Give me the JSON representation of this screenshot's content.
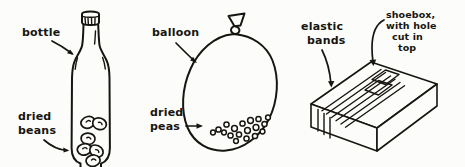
{
  "illustration": {
    "title": "Homemade shaker instruments",
    "style": "hand-drawn black ink line art on white paper",
    "background_color": "#fcfcfa",
    "ink_color": "#17150f"
  },
  "figures": [
    {
      "id": "bottle-figure",
      "object": "bottle",
      "object_icon": "bottle-icon",
      "contents": "dried beans",
      "contents_icon": "bean-icon",
      "contents_count": 6,
      "labels": [
        {
          "text": "bottle",
          "lines": [
            "bottle"
          ],
          "points_to": "bottle neck"
        },
        {
          "text": "dried beans",
          "lines": [
            "dried",
            "beans"
          ],
          "points_to": "beans inside bottle"
        }
      ]
    },
    {
      "id": "balloon-figure",
      "object": "balloon",
      "object_icon": "balloon-icon",
      "contents": "dried peas",
      "contents_icon": "pea-icon",
      "contents_count": 18,
      "labels": [
        {
          "text": "balloon",
          "lines": [
            "balloon"
          ],
          "points_to": "balloon body"
        },
        {
          "text": "dried peas",
          "lines": [
            "dried",
            "peas"
          ],
          "points_to": "peas inside balloon"
        }
      ]
    },
    {
      "id": "shoebox-figure",
      "object": "shoebox with hole cut in top",
      "object_icon": "shoebox-icon",
      "contents": "elastic bands",
      "contents_icon": "elastic-band-icon",
      "contents_count": 3,
      "labels": [
        {
          "text": "elastic bands",
          "lines": [
            "elastic",
            "bands"
          ],
          "points_to": "elastic bands over box"
        },
        {
          "text": "shoebox with hole cut in top",
          "lines": [
            "shoebox,",
            "with hole",
            "cut in",
            "top"
          ],
          "points_to": "top of shoebox"
        }
      ]
    }
  ],
  "text": {
    "bottle": "bottle",
    "dried": "dried",
    "beans": "beans",
    "balloon": "balloon",
    "peas": "peas",
    "elastic": "elastic",
    "bands": "bands",
    "shoebox_l1": "shoebox,",
    "shoebox_l2": "with hole",
    "shoebox_l3": "cut in",
    "shoebox_l4": "top"
  }
}
